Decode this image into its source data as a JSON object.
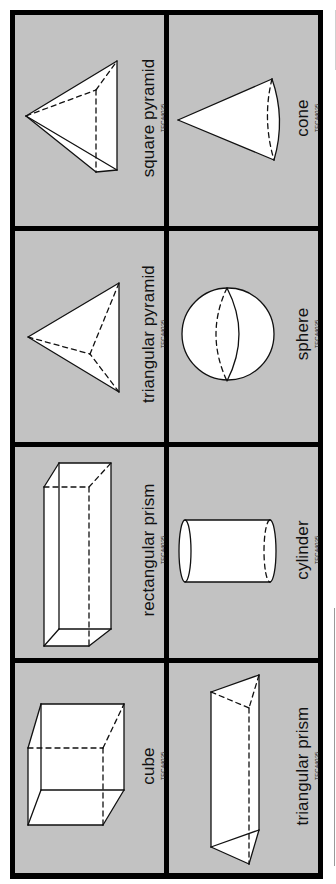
{
  "sheet": {
    "background": "#ffffff",
    "card_color": "#c2c2c2",
    "border_color": "#000000",
    "shape_fill": "#ffffff"
  },
  "cards": [
    {
      "name": "square pyramid",
      "code": "TEC44035"
    },
    {
      "name": "cone",
      "code": "TEC44035"
    },
    {
      "name": "triangular pyramid",
      "code": "TEC44035"
    },
    {
      "name": "sphere",
      "code": "TEC44035"
    },
    {
      "name": "rectangular prism",
      "code": "TEC44035"
    },
    {
      "name": "cylinder",
      "code": "TEC44035"
    },
    {
      "name": "cube",
      "code": "TEC44035"
    },
    {
      "name": "triangular prism",
      "code": "TEC44035"
    }
  ]
}
